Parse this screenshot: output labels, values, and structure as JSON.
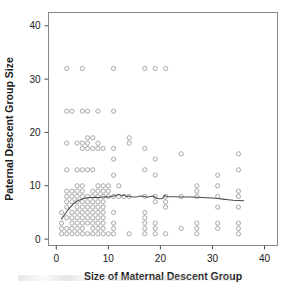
{
  "chart_data": {
    "type": "scatter",
    "title": "",
    "xlabel": "Size of Maternal Descent Group",
    "ylabel": "Paternal Descent Group Size",
    "xlim": [
      -1.5,
      42.5
    ],
    "ylim": [
      -1.2,
      42.5
    ],
    "xticks": [
      0,
      10,
      20,
      30,
      40
    ],
    "yticks": [
      0,
      10,
      20,
      30,
      40
    ],
    "xtick_labels": [
      "0",
      "10",
      "20",
      "30",
      "40"
    ],
    "ytick_labels": [
      "0",
      "10",
      "20",
      "30",
      "40"
    ],
    "grid": false,
    "legend": "none",
    "marker": "open-circle",
    "marker_color": "#9a9a9a",
    "curve_color": "#4a4a4a",
    "frame_color": "#888888",
    "points": [
      [
        2,
        32
      ],
      [
        5,
        32
      ],
      [
        11,
        32
      ],
      [
        17,
        32
      ],
      [
        19,
        32
      ],
      [
        21,
        32
      ],
      [
        2,
        24
      ],
      [
        3,
        24
      ],
      [
        5,
        24
      ],
      [
        6,
        24
      ],
      [
        8,
        24
      ],
      [
        11,
        24
      ],
      [
        6,
        19
      ],
      [
        7,
        19
      ],
      [
        14,
        19
      ],
      [
        2,
        18
      ],
      [
        4,
        18
      ],
      [
        5,
        18
      ],
      [
        6,
        18
      ],
      [
        8,
        18
      ],
      [
        14,
        18
      ],
      [
        5,
        17
      ],
      [
        6,
        17
      ],
      [
        7,
        17
      ],
      [
        8,
        17
      ],
      [
        9,
        17
      ],
      [
        11,
        17
      ],
      [
        17,
        17
      ],
      [
        24,
        16
      ],
      [
        35,
        16
      ],
      [
        11,
        15
      ],
      [
        19,
        15
      ],
      [
        11,
        12
      ],
      [
        19,
        12
      ],
      [
        31,
        12
      ],
      [
        2,
        13
      ],
      [
        4,
        13
      ],
      [
        5,
        13
      ],
      [
        6,
        13
      ],
      [
        7,
        13
      ],
      [
        17,
        13
      ],
      [
        35,
        13
      ],
      [
        4,
        10
      ],
      [
        5,
        10
      ],
      [
        8,
        10
      ],
      [
        9,
        10
      ],
      [
        10,
        10
      ],
      [
        12,
        10
      ],
      [
        27,
        10
      ],
      [
        31,
        10
      ],
      [
        2,
        9
      ],
      [
        3,
        9
      ],
      [
        4,
        9
      ],
      [
        5,
        9
      ],
      [
        7,
        9
      ],
      [
        8,
        9
      ],
      [
        9,
        9
      ],
      [
        10,
        9
      ],
      [
        27,
        9
      ],
      [
        35,
        9
      ],
      [
        2,
        8
      ],
      [
        3,
        8
      ],
      [
        4,
        8
      ],
      [
        5,
        8
      ],
      [
        6,
        8
      ],
      [
        7,
        8
      ],
      [
        8,
        8
      ],
      [
        9,
        8
      ],
      [
        10,
        8
      ],
      [
        11,
        8
      ],
      [
        12,
        8
      ],
      [
        13,
        8
      ],
      [
        14,
        8
      ],
      [
        17,
        8
      ],
      [
        19,
        8
      ],
      [
        21,
        8
      ],
      [
        24,
        8
      ],
      [
        27,
        8
      ],
      [
        31,
        8
      ],
      [
        35,
        8
      ],
      [
        2,
        7
      ],
      [
        3,
        7
      ],
      [
        4,
        7
      ],
      [
        5,
        7
      ],
      [
        6,
        7
      ],
      [
        7,
        7
      ],
      [
        8,
        7
      ],
      [
        9,
        7
      ],
      [
        19,
        7
      ],
      [
        21,
        7
      ],
      [
        2,
        6
      ],
      [
        4,
        6
      ],
      [
        5,
        6
      ],
      [
        6,
        6
      ],
      [
        7,
        6
      ],
      [
        8,
        6
      ],
      [
        9,
        6
      ],
      [
        21,
        6
      ],
      [
        31,
        6
      ],
      [
        35,
        6
      ],
      [
        1,
        5
      ],
      [
        3,
        5
      ],
      [
        4,
        5
      ],
      [
        5,
        5
      ],
      [
        6,
        5
      ],
      [
        7,
        5
      ],
      [
        8,
        5
      ],
      [
        9,
        5
      ],
      [
        11,
        5
      ],
      [
        17,
        5
      ],
      [
        2,
        4
      ],
      [
        3,
        4
      ],
      [
        4,
        4
      ],
      [
        5,
        4
      ],
      [
        6,
        4
      ],
      [
        7,
        4
      ],
      [
        8,
        4
      ],
      [
        9,
        4
      ],
      [
        17,
        4
      ],
      [
        1,
        3
      ],
      [
        3,
        3
      ],
      [
        4,
        3
      ],
      [
        5,
        3
      ],
      [
        6,
        3
      ],
      [
        7,
        3
      ],
      [
        8,
        3
      ],
      [
        9,
        3
      ],
      [
        11,
        3
      ],
      [
        17,
        3
      ],
      [
        19,
        3
      ],
      [
        27,
        3
      ],
      [
        31,
        3
      ],
      [
        35,
        3
      ],
      [
        1,
        2
      ],
      [
        2,
        2
      ],
      [
        3,
        2
      ],
      [
        4,
        2
      ],
      [
        5,
        2
      ],
      [
        7,
        2
      ],
      [
        8,
        2
      ],
      [
        9,
        2
      ],
      [
        11,
        2
      ],
      [
        17,
        2
      ],
      [
        19,
        2
      ],
      [
        24,
        2
      ],
      [
        27,
        2
      ],
      [
        31,
        2
      ],
      [
        35,
        2
      ],
      [
        1,
        1
      ],
      [
        2,
        1
      ],
      [
        3,
        1
      ],
      [
        4,
        1
      ],
      [
        5,
        1
      ],
      [
        6,
        1
      ],
      [
        7,
        1
      ],
      [
        8,
        1
      ],
      [
        9,
        1
      ],
      [
        10,
        1
      ],
      [
        11,
        1
      ],
      [
        14,
        1
      ],
      [
        17,
        1
      ],
      [
        19,
        1
      ],
      [
        21,
        1
      ],
      [
        27,
        1
      ],
      [
        35,
        1
      ]
    ],
    "curve": [
      [
        1.0,
        3.8
      ],
      [
        1.6,
        4.6
      ],
      [
        2.2,
        5.4
      ],
      [
        2.8,
        6.1
      ],
      [
        3.4,
        6.7
      ],
      [
        4.0,
        7.1
      ],
      [
        4.6,
        7.4
      ],
      [
        5.2,
        7.6
      ],
      [
        5.8,
        7.7
      ],
      [
        6.4,
        7.8
      ],
      [
        7.0,
        7.8
      ],
      [
        7.6,
        7.85
      ],
      [
        8.2,
        7.8
      ],
      [
        8.8,
        7.9
      ],
      [
        9.4,
        7.95
      ],
      [
        10.0,
        7.9
      ],
      [
        10.6,
        8.0
      ],
      [
        11.2,
        8.15
      ],
      [
        11.8,
        8.3
      ],
      [
        12.2,
        8.35
      ],
      [
        12.6,
        8.1
      ],
      [
        13.0,
        8.3
      ],
      [
        13.4,
        8.0
      ],
      [
        13.8,
        8.1
      ],
      [
        14.4,
        7.95
      ],
      [
        15.0,
        7.9
      ],
      [
        15.6,
        7.95
      ],
      [
        16.2,
        8.1
      ],
      [
        16.8,
        8.05
      ],
      [
        17.4,
        7.85
      ],
      [
        18.0,
        8.0
      ],
      [
        18.6,
        8.1
      ],
      [
        19.2,
        7.7
      ],
      [
        19.8,
        7.55
      ],
      [
        20.4,
        7.6
      ],
      [
        20.8,
        8.2
      ],
      [
        21.2,
        8.0
      ],
      [
        22.0,
        7.95
      ],
      [
        23.0,
        7.95
      ],
      [
        24.0,
        7.9
      ],
      [
        25.0,
        7.9
      ],
      [
        26.0,
        7.9
      ],
      [
        27.0,
        7.85
      ],
      [
        28.0,
        7.8
      ],
      [
        29.0,
        7.75
      ],
      [
        30.0,
        7.7
      ],
      [
        31.0,
        7.6
      ],
      [
        32.0,
        7.5
      ],
      [
        33.0,
        7.4
      ],
      [
        34.0,
        7.3
      ],
      [
        35.0,
        7.25
      ],
      [
        36.0,
        7.2
      ]
    ]
  }
}
